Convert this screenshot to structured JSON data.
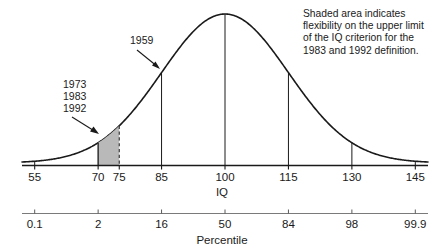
{
  "chart_data": {
    "type": "line",
    "title": "",
    "subtitle": "",
    "xlabel": "IQ",
    "ylabel": "",
    "secondary_xlabel": "Percentile",
    "grid": false,
    "legend_position": "none",
    "curve": {
      "name": "Normal distribution of IQ",
      "distribution": "normal",
      "mean": 100,
      "sd": 15
    },
    "xlim": [
      52,
      148
    ],
    "x_ticks": [
      {
        "value": 55,
        "label": "55"
      },
      {
        "value": 70,
        "label": "70"
      },
      {
        "value": 75,
        "label": "75"
      },
      {
        "value": 85,
        "label": "85"
      },
      {
        "value": 100,
        "label": "100"
      },
      {
        "value": 115,
        "label": "115"
      },
      {
        "value": 130,
        "label": "130"
      },
      {
        "value": 145,
        "label": "145"
      }
    ],
    "percentile_ticks": [
      {
        "iq": 55,
        "label": "0.1"
      },
      {
        "iq": 70,
        "label": "2"
      },
      {
        "iq": 85,
        "label": "16"
      },
      {
        "iq": 100,
        "label": "50"
      },
      {
        "iq": 115,
        "label": "84"
      },
      {
        "iq": 130,
        "label": "98"
      },
      {
        "iq": 145,
        "label": "99.9"
      }
    ],
    "drop_lines": [
      55,
      70,
      85,
      100,
      115,
      130,
      145
    ],
    "shaded_region": {
      "from": 70,
      "to": 75,
      "fill_color": "#b9b9b9",
      "right_edge_style": "dashed"
    },
    "annotations": [
      {
        "name": "years-1959",
        "lines": [
          "1959"
        ],
        "points_to_iq": 83.5
      },
      {
        "name": "years-1973-1983-1992",
        "lines": [
          "1973",
          "1983",
          "1992"
        ],
        "points_to_iq": 71.5
      }
    ],
    "note": {
      "lines": [
        "Shaded area indicates",
        "flexibility on the upper limit",
        "of the IQ criterion for the",
        "1983 and 1992 definition."
      ]
    }
  },
  "colors": {
    "ink": "#1a1a1a",
    "curve": "#1a1a1a",
    "shade": "#b9b9b9",
    "background": "#ffffff"
  }
}
